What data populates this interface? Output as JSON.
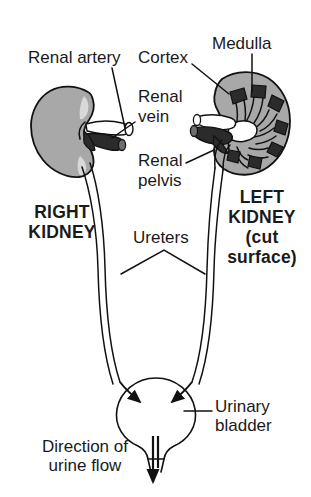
{
  "figure": {
    "background_color": "#ffffff",
    "line_color": "#111111",
    "kidney_fill_color": "#a8a8a8",
    "medulla_fill_color": "#2b2b2b",
    "artery_fill_color": "#2b2b2b",
    "vein_fill_color": "#ffffff"
  },
  "labels": {
    "renal_artery": "Renal artery",
    "cortex": "Cortex",
    "medulla": "Medulla",
    "renal_vein_line1": "Renal",
    "renal_vein_line2": "vein",
    "renal_pelvis_line1": "Renal",
    "renal_pelvis_line2": "pelvis",
    "right_kidney_line1": "RIGHT",
    "right_kidney_line2": "KIDNEY",
    "left_kidney_line1": "LEFT",
    "left_kidney_line2": "KIDNEY",
    "left_kidney_line3": "(cut",
    "left_kidney_line4": "surface)",
    "ureters": "Ureters",
    "urinary_bladder_line1": "Urinary",
    "urinary_bladder_line2": "bladder",
    "direction_line1": "Direction of",
    "direction_line2": "urine flow"
  },
  "structures": {
    "right_kidney": "right-kidney-intact",
    "left_kidney": "left-kidney-cut-surface",
    "renal_artery": "renal-artery",
    "renal_vein": "renal-vein",
    "renal_pelvis": "renal-pelvis",
    "ureter_left": "left-ureter",
    "ureter_right": "right-ureter",
    "bladder": "urinary-bladder",
    "urethra": "urethra",
    "medullary_pyramid_count": 8
  }
}
